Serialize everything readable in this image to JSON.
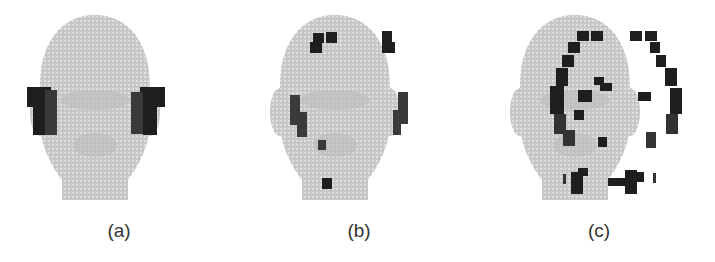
{
  "figure": {
    "panels": [
      {
        "id": "a",
        "label": "(a)",
        "description": "Head mesh with dark patches on both ears"
      },
      {
        "id": "b",
        "label": "(b)",
        "description": "Head mesh with patches on top of head, ears and chin"
      },
      {
        "id": "c",
        "label": "(c)",
        "description": "Head mesh with patches outlining head, eyes, nose, ears and mouth"
      }
    ],
    "colors": {
      "mesh": "#c8c8c8",
      "patch": "#1e1e1e",
      "background": "#ffffff"
    }
  }
}
